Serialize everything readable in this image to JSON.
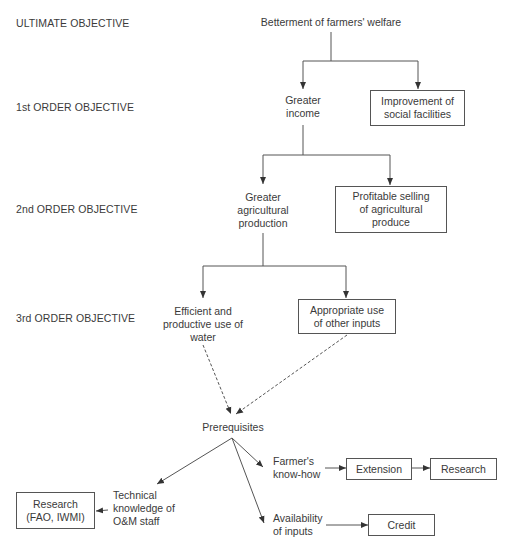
{
  "levels": {
    "ultimate": "ULTIMATE OBJECTIVE",
    "first": "1st ORDER OBJECTIVE",
    "second": "2nd ORDER OBJECTIVE",
    "third": "3rd ORDER OBJECTIVE"
  },
  "nodes": {
    "welfare": "Betterment of farmers' welfare",
    "income": [
      "Greater",
      "income"
    ],
    "social": [
      "Improvement of",
      "social facilities"
    ],
    "production": [
      "Greater",
      "agricultural",
      "production"
    ],
    "selling": [
      "Profitable selling",
      "of agricultural",
      "produce"
    ],
    "water": [
      "Efficient and",
      "productive use of",
      "water"
    ],
    "inputs": [
      "Appropriate use",
      "of other inputs"
    ],
    "prerequisites": "Prerequisites",
    "technical": [
      "Technical",
      "knowledge of",
      "O&M staff"
    ],
    "research_fao": [
      "Research",
      "(FAO, IWMI)"
    ],
    "knowhow": [
      "Farmer's",
      "know-how"
    ],
    "extension": "Extension",
    "research": "Research",
    "availability": [
      "Availability",
      "of inputs"
    ],
    "credit": "Credit"
  },
  "colors": {
    "line": "#555555",
    "text": "#3a3a3a"
  }
}
